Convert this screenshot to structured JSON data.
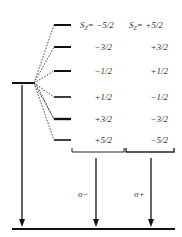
{
  "diagram": {
    "type": "energy-level-diagram",
    "header": {
      "left": {
        "prefix": "S",
        "sub": "Z",
        "value": "= −5/2"
      },
      "right": {
        "prefix": "S",
        "sub": "Z",
        "value": "= +5/2"
      }
    },
    "levels": [
      {
        "left": "−5/2",
        "right": "+5/2"
      },
      {
        "left": "−3/2",
        "right": "+3/2"
      },
      {
        "left": "−1/2",
        "right": "+1/2"
      },
      {
        "left": "+1/2",
        "right": "−1/2"
      },
      {
        "left": "+3/2",
        "right": "−3/2"
      },
      {
        "left": "+5/2",
        "right": "−5/2"
      }
    ],
    "transitions": [
      {
        "label": "σ−"
      },
      {
        "label": "σ+"
      }
    ],
    "colors": {
      "line": "#111111",
      "text": "#333333",
      "background": "#ffffff"
    }
  }
}
